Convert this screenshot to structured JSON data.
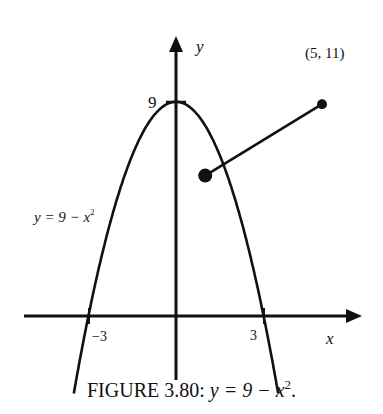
{
  "chart_data": {
    "type": "line",
    "xlabel": "x",
    "ylabel": "y",
    "x_ticks": [
      {
        "value": -3,
        "label": "−3"
      },
      {
        "value": 3,
        "label": "3"
      }
    ],
    "y_ticks": [
      {
        "value": 9,
        "label": "9"
      }
    ],
    "grid": false,
    "series": [
      {
        "name": "y = 9 − x²",
        "kind": "parabola",
        "formula": "9 - x^2",
        "x_range": [
          -3.5,
          3.5
        ]
      },
      {
        "name": "segment",
        "kind": "segment",
        "points": [
          [
            1,
            8
          ],
          [
            5,
            11
          ]
        ],
        "endpoints": "filled-dots"
      }
    ],
    "annotations": [
      {
        "text": "(5, 11)",
        "at": [
          5,
          11
        ]
      },
      {
        "text": "y = 9 − x²",
        "position": "left of curve"
      }
    ]
  },
  "labels": {
    "y_axis": "y",
    "x_axis": "x",
    "tick_9": "9",
    "tick_neg3": "−3",
    "tick_3": "3",
    "point": "(5, 11)",
    "curve_label": "y = 9 − x",
    "curve_label_sup": "2"
  },
  "caption": {
    "prefix": "FIGURE 3.80: ",
    "math": "y = 9 − x",
    "sup": "2",
    "suffix": "."
  }
}
